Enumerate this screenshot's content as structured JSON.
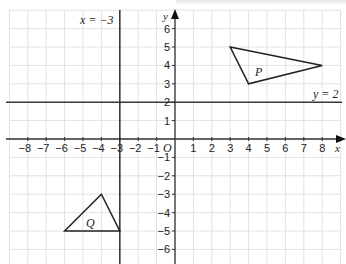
{
  "diagram": {
    "type": "coordinate-grid",
    "x_axis": {
      "label": "x",
      "min": -8,
      "max": 8,
      "ticks": [
        -8,
        -7,
        -6,
        -5,
        -4,
        -3,
        -2,
        -1,
        1,
        2,
        3,
        4,
        5,
        6,
        7,
        8
      ]
    },
    "y_axis": {
      "label": "y",
      "min": -6,
      "max": 6,
      "ticks": [
        6,
        5,
        4,
        3,
        2,
        1,
        -1,
        -2,
        -3,
        -4,
        -5,
        -6
      ]
    },
    "origin_label": "O",
    "lines": [
      {
        "id": "x-eq-neg3",
        "label": "x = −3",
        "orientation": "vertical",
        "value": -3
      },
      {
        "id": "y-eq-2",
        "label": "y = 2",
        "orientation": "horizontal",
        "value": 2
      }
    ],
    "shapes": [
      {
        "id": "P",
        "label": "P",
        "vertices": [
          [
            3,
            5
          ],
          [
            8,
            4
          ],
          [
            4,
            3
          ]
        ]
      },
      {
        "id": "Q",
        "label": "Q",
        "vertices": [
          [
            -4,
            -3
          ],
          [
            -6,
            -5
          ],
          [
            -3,
            -5
          ]
        ]
      }
    ],
    "colors": {
      "grid": "#e2e2e2",
      "axis": "#333333",
      "line": "#3a3a3a",
      "shape": "#222222"
    }
  },
  "labels": {
    "x_eq_neg3": "x = −3",
    "y_eq_2": "y = 2",
    "P": "P",
    "Q": "Q",
    "O": "O",
    "x": "x",
    "y": "y"
  }
}
